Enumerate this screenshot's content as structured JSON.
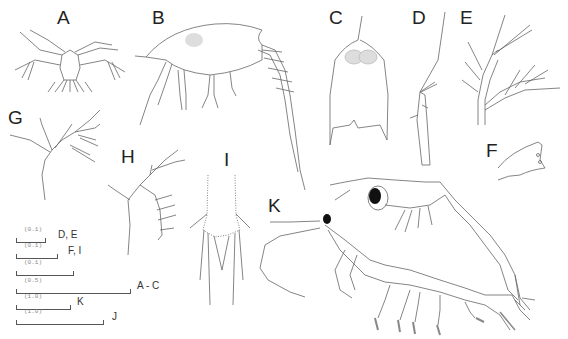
{
  "figure": {
    "panels": [
      {
        "id": "A",
        "label": "A",
        "x": 57,
        "y": 8
      },
      {
        "id": "B",
        "label": "B",
        "x": 152,
        "y": 8
      },
      {
        "id": "C",
        "label": "C",
        "x": 329,
        "y": 8
      },
      {
        "id": "D",
        "label": "D",
        "x": 412,
        "y": 8
      },
      {
        "id": "E",
        "label": "E",
        "x": 460,
        "y": 8
      },
      {
        "id": "F",
        "label": "F",
        "x": 486,
        "y": 141
      },
      {
        "id": "G",
        "label": "G",
        "x": 8,
        "y": 108
      },
      {
        "id": "H",
        "label": "H",
        "x": 121,
        "y": 147
      },
      {
        "id": "I",
        "label": "I",
        "x": 224,
        "y": 150
      },
      {
        "id": "K",
        "label": "K",
        "x": 268,
        "y": 196
      }
    ],
    "scale_bars": [
      {
        "value": "(0.1)",
        "label": "D, E",
        "width": 28,
        "y": 236,
        "label_x": 58
      },
      {
        "value": "(0.1)",
        "label": "F, I",
        "width": 40,
        "y": 252,
        "label_x": 68
      },
      {
        "value": "(0.1)",
        "label": "",
        "width": 56,
        "y": 270,
        "label_x": 0
      },
      {
        "value": "(0.5)",
        "label": "A - C",
        "width": 113,
        "y": 287,
        "label_x": 137
      },
      {
        "value": "(1.0)",
        "label": "K",
        "width": 53,
        "y": 303,
        "label_x": 77
      },
      {
        "value": "(1.0)",
        "label": "J",
        "width": 86,
        "y": 319,
        "label_x": 112
      }
    ],
    "colors": {
      "ink": "#555555",
      "label": "#222222",
      "shade": "#bbbbbb",
      "eye": "#111111"
    }
  }
}
